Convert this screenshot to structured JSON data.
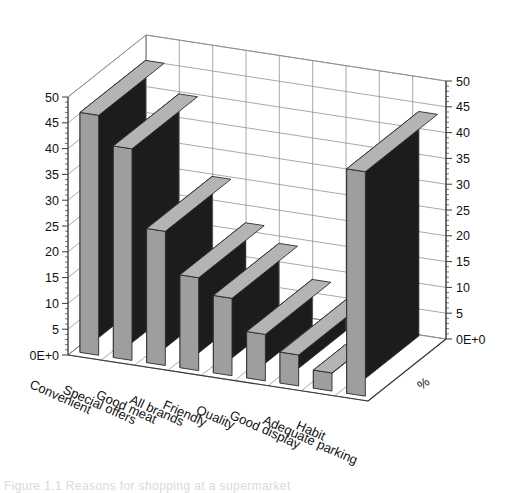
{
  "chart_data": {
    "type": "bar",
    "title": "",
    "subtitle": "",
    "xlabel": "",
    "ylabel": "%",
    "depth_axis_label": "%",
    "projection": "3d-isometric",
    "grid": true,
    "legend": "none",
    "ylim": [
      0,
      50
    ],
    "y_ticks": [
      "0E+0",
      "5",
      "10",
      "15",
      "20",
      "25",
      "30",
      "35",
      "40",
      "45",
      "50"
    ],
    "y_tick_values": [
      0,
      5,
      10,
      15,
      20,
      25,
      30,
      35,
      40,
      45,
      50
    ],
    "left_axis_ticks": [
      "0E+0",
      "5",
      "10",
      "15",
      "20",
      "25",
      "30",
      "35",
      "40",
      "45",
      "50"
    ],
    "right_axis_ticks": [
      "0E+0",
      "5",
      "10",
      "15",
      "20",
      "25",
      "30",
      "35",
      "40",
      "45",
      "50"
    ],
    "categories": [
      "Convenient",
      "Special offers",
      "Good meat",
      "All brands",
      "Friendly",
      "Quality",
      "Good display",
      "Adequate parking",
      "Habit"
    ],
    "values": [
      46.5,
      41,
      26,
      18,
      15,
      9,
      6,
      3.5,
      43.5
    ],
    "series": [
      {
        "name": "%",
        "values": [
          46.5,
          41,
          26,
          18,
          15,
          9,
          6,
          3.5,
          43.5
        ]
      }
    ],
    "colors": {
      "bar_front": "#9e9e9e",
      "bar_side": "#1c1c1c",
      "bar_top": "#b4b4b4",
      "bar_outline": "#2b2b2b",
      "grid_line": "#8c8c8c",
      "axis_line": "#3a3a3a",
      "background": "#ffffff",
      "text": "#111111"
    }
  },
  "caption": {
    "text": "Figure 1.1 Reasons for shopping at a supermarket"
  }
}
